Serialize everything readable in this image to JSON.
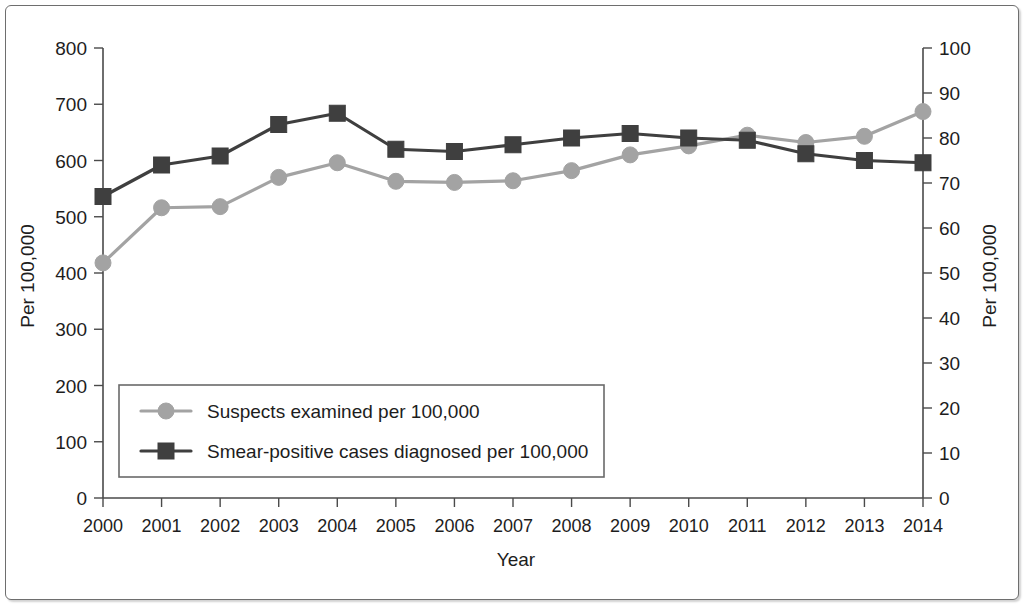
{
  "chart_data": {
    "type": "line",
    "title": "",
    "xlabel": "Year",
    "ylabel": "Per 100,000",
    "y2label": "Per 100,000",
    "grid": false,
    "legend_position": "inside-lower-left",
    "categories": [
      "2000",
      "2001",
      "2002",
      "2003",
      "2004",
      "2005",
      "2006",
      "2007",
      "2008",
      "2009",
      "2010",
      "2011",
      "2012",
      "2013",
      "2014"
    ],
    "x": [
      2000,
      2001,
      2002,
      2003,
      2004,
      2005,
      2006,
      2007,
      2008,
      2009,
      2010,
      2011,
      2012,
      2013,
      2014
    ],
    "ylim": [
      0,
      800
    ],
    "yticks": [
      0,
      100,
      200,
      300,
      400,
      500,
      600,
      700,
      800
    ],
    "ytick_labels": [
      "0",
      "100",
      "200",
      "300",
      "400",
      "500",
      "600",
      "700",
      "800"
    ],
    "y2lim": [
      0,
      100
    ],
    "y2ticks": [
      0,
      10,
      20,
      30,
      40,
      50,
      60,
      70,
      80,
      90,
      100
    ],
    "y2tick_labels": [
      "0",
      "10",
      "20",
      "30",
      "40",
      "50",
      "60",
      "70",
      "80",
      "90",
      "100"
    ],
    "series": [
      {
        "name": "Suspects examined per 100,000",
        "axis": "left",
        "marker": "circle",
        "color": "#a3a3a3",
        "values": [
          418,
          516,
          518,
          570,
          596,
          563,
          561,
          564,
          582,
          610,
          626,
          645,
          632,
          643,
          687
        ]
      },
      {
        "name": "Smear-positive cases diagnosed per 100,000",
        "axis": "right",
        "marker": "square",
        "color": "#3f3f3f",
        "values": [
          67.0,
          74.0,
          76.0,
          83.0,
          85.5,
          77.5,
          77.0,
          78.5,
          80.0,
          81.0,
          80.0,
          79.5,
          76.5,
          75.0,
          74.5
        ]
      }
    ]
  },
  "axes": {
    "left_title": "Per 100,000",
    "right_title": "Per 100,000",
    "x_title": "Year"
  },
  "legend": {
    "items": [
      {
        "label": "Suspects examined per 100,000",
        "marker": "circle-marker",
        "color": "#a3a3a3"
      },
      {
        "label": "Smear-positive cases diagnosed per 100,000",
        "marker": "square-marker",
        "color": "#3f3f3f"
      }
    ]
  }
}
